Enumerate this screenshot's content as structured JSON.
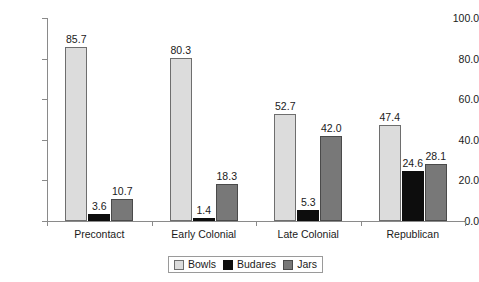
{
  "chart_data": {
    "type": "bar",
    "title": "",
    "subtitle": "",
    "xlabel": "",
    "ylabel": "",
    "categories": [
      "Precontact",
      "Early Colonial",
      "Late Colonial",
      "Republican"
    ],
    "series": [
      {
        "name": "Bowls",
        "color": "#dcdcdc",
        "values": [
          85.7,
          80.3,
          52.7,
          47.4
        ]
      },
      {
        "name": "Budares",
        "color": "#0d0d0d",
        "values": [
          3.6,
          1.4,
          5.3,
          24.6
        ]
      },
      {
        "name": "Jars",
        "color": "#787878",
        "values": [
          10.7,
          18.3,
          42.0,
          28.1
        ]
      }
    ],
    "data_labels": [
      [
        "85.7",
        "3.6",
        "10.7"
      ],
      [
        "80.3",
        "1.4",
        "18.3"
      ],
      [
        "52.7",
        "5.3",
        "42.0"
      ],
      [
        "47.4",
        "24.6",
        "28.1"
      ]
    ],
    "ylim": [
      0,
      100
    ],
    "yticks": [
      0,
      20,
      40,
      60,
      80,
      100
    ],
    "ytick_labels": [
      "0.0",
      "20.0",
      "40.0",
      "60.0",
      "80.0",
      "100.0"
    ],
    "grid": false,
    "legend_position": "bottom-center",
    "legend_entries": [
      "Bowls",
      "Budares",
      "Jars"
    ]
  }
}
